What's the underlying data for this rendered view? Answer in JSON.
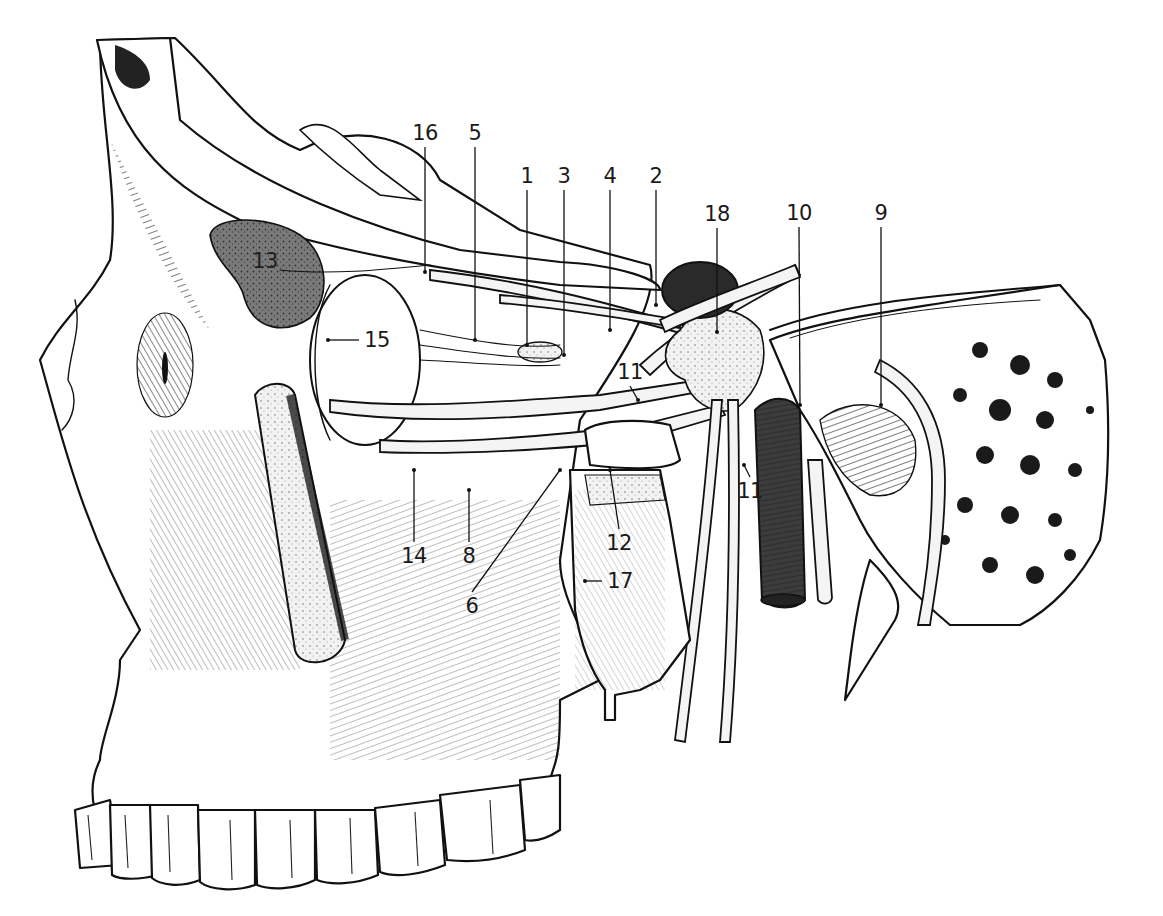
{
  "figure": {
    "colors": {
      "ink": "#111111",
      "background": "#ffffff",
      "gland_fill": "#6e6e6e",
      "vessel_fill": "#3c3c3c",
      "nerve_fill": "#f4f4f4",
      "ganglion_fill": "#e6e6e6"
    }
  },
  "labels": [
    {
      "id": "1",
      "text": "1",
      "x": 527,
      "y": 176,
      "leader_to": [
        527,
        345
      ]
    },
    {
      "id": "2",
      "text": "2",
      "x": 656,
      "y": 176,
      "leader_to": [
        656,
        305
      ]
    },
    {
      "id": "3",
      "text": "3",
      "x": 564,
      "y": 176,
      "leader_to": [
        564,
        355
      ]
    },
    {
      "id": "4",
      "text": "4",
      "x": 610,
      "y": 176,
      "leader_to": [
        610,
        330
      ]
    },
    {
      "id": "5",
      "text": "5",
      "x": 475,
      "y": 133,
      "leader_to": [
        475,
        340
      ]
    },
    {
      "id": "6",
      "text": "6",
      "x": 472,
      "y": 606,
      "leader_to": [
        560,
        470
      ]
    },
    {
      "id": "8",
      "text": "8",
      "x": 469,
      "y": 556,
      "leader_to": [
        469,
        490
      ]
    },
    {
      "id": "9",
      "text": "9",
      "x": 881,
      "y": 213,
      "leader_to": [
        881,
        405
      ]
    },
    {
      "id": "10",
      "text": "10",
      "x": 799,
      "y": 213,
      "leader_to": [
        800,
        405
      ]
    },
    {
      "id": "11a",
      "text": "11",
      "x": 630,
      "y": 372,
      "leader_to": [
        638,
        400
      ]
    },
    {
      "id": "11b",
      "text": "11",
      "x": 750,
      "y": 491,
      "leader_to": [
        744,
        465
      ]
    },
    {
      "id": "12",
      "text": "12",
      "x": 619,
      "y": 543,
      "leader_to": [
        610,
        470
      ]
    },
    {
      "id": "13",
      "text": "13",
      "x": 265,
      "y": 261,
      "leader_to": null
    },
    {
      "id": "14",
      "text": "14",
      "x": 414,
      "y": 556,
      "leader_to": [
        414,
        470
      ]
    },
    {
      "id": "15",
      "text": "15",
      "x": 377,
      "y": 340,
      "leader_to": [
        328,
        340
      ]
    },
    {
      "id": "16",
      "text": "16",
      "x": 425,
      "y": 133,
      "leader_to": [
        425,
        272
      ]
    },
    {
      "id": "17",
      "text": "17",
      "x": 620,
      "y": 581,
      "leader_to": [
        585,
        581
      ]
    },
    {
      "id": "18",
      "text": "18",
      "x": 717,
      "y": 214,
      "leader_to": [
        717,
        332
      ]
    }
  ]
}
